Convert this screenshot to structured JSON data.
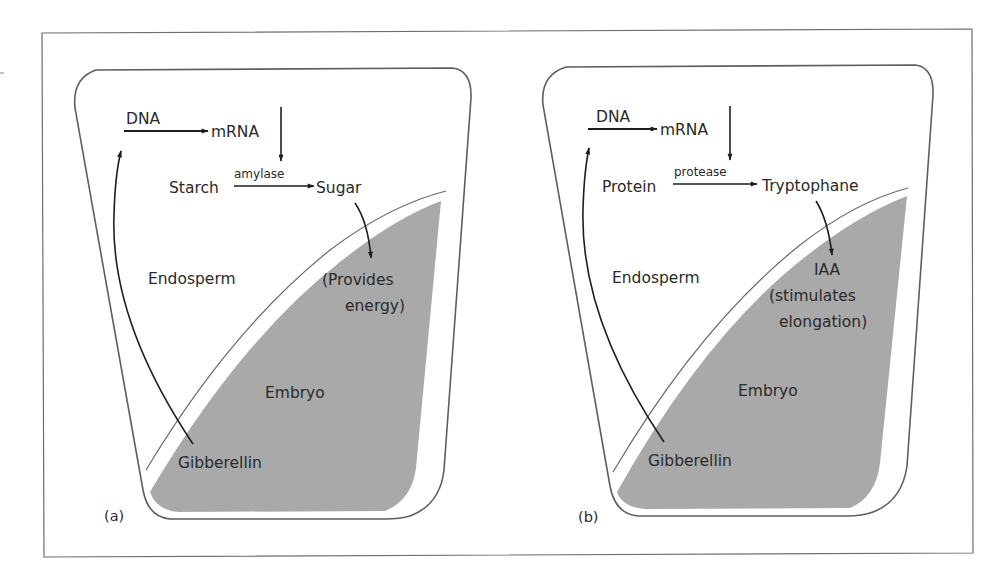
{
  "figure": {
    "colors": {
      "frame": "#6e6e6e",
      "seed_outline": "#5e5e5e",
      "embryo_fill": "#a9a9a9",
      "arrow": "#1e1e1e",
      "text": "#2a2a2a"
    },
    "panels": [
      {
        "id": "a",
        "panel_label": "(a)",
        "dna": "DNA",
        "mrna": "mRNA",
        "substrate": "Starch",
        "enzyme": "amylase",
        "product": "Sugar",
        "effect_line1": "(Provides",
        "effect_line2": "energy)",
        "effect_line3": "",
        "endosperm": "Endosperm",
        "embryo": "Embryo",
        "hormone": "Gibberellin"
      },
      {
        "id": "b",
        "panel_label": "(b)",
        "dna": "DNA",
        "mrna": "mRNA",
        "substrate": "Protein",
        "enzyme": "protease",
        "product": "Tryptophane",
        "effect_line1": "IAA",
        "effect_line2": "(stimulates",
        "effect_line3": "elongation)",
        "endosperm": "Endosperm",
        "embryo": "Embryo",
        "hormone": "Gibberellin"
      }
    ]
  }
}
